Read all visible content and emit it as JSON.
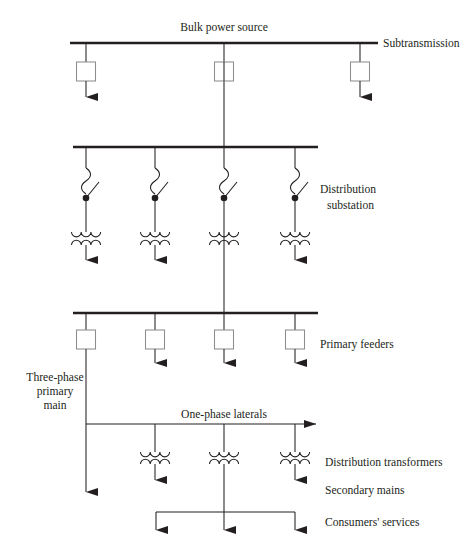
{
  "figure": {
    "stroke_color": "#231f20",
    "bus_color": "#231f20",
    "box_stroke": "#8d8d8d",
    "background": "#ffffff"
  },
  "labels": {
    "bulk_power_source": "Bulk power source",
    "subtransmission": "Subtransmission",
    "distribution_substation_line1": "Distribution",
    "distribution_substation_line2": "substation",
    "primary_feeders": "Primary feeders",
    "three_phase_line1": "Three-phase",
    "three_phase_line2": "primary",
    "three_phase_line3": "main",
    "one_phase_laterals": "One-phase laterals",
    "distribution_transformers": "Distribution transformers",
    "secondary_mains": "Secondary mains",
    "consumers_services": "Consumers' services"
  },
  "diagram_data": {
    "type": "diagram",
    "levels": [
      {
        "name": "subtransmission-bus",
        "bus_y": 43,
        "bus_x1": 70,
        "bus_x2": 378,
        "drops": [
          {
            "x": 86,
            "symbol": "breaker-box",
            "terminates": "arrow"
          },
          {
            "x": 224,
            "symbol": "breaker-box",
            "terminates": "continues-down"
          },
          {
            "x": 360,
            "symbol": "breaker-box",
            "terminates": "arrow"
          }
        ]
      },
      {
        "name": "distribution-substation-bus",
        "bus_y": 147,
        "bus_x1": 73,
        "bus_x2": 318,
        "drops": [
          {
            "x": 86,
            "symbol": "fuse-switch-transformer",
            "terminates": "arrow"
          },
          {
            "x": 155,
            "symbol": "fuse-switch-transformer",
            "terminates": "arrow"
          },
          {
            "x": 224,
            "symbol": "fuse-switch-transformer",
            "terminates": "continues-down"
          },
          {
            "x": 295,
            "symbol": "fuse-switch-transformer",
            "terminates": "arrow"
          }
        ]
      },
      {
        "name": "primary-feeders-bus",
        "bus_y": 313,
        "bus_x1": 73,
        "bus_x2": 318,
        "drops": [
          {
            "x": 86,
            "symbol": "breaker-box",
            "terminates": "continues-down"
          },
          {
            "x": 155,
            "symbol": "breaker-box",
            "terminates": "arrow"
          },
          {
            "x": 224,
            "symbol": "breaker-box",
            "terminates": "arrow"
          },
          {
            "x": 295,
            "symbol": "breaker-box",
            "terminates": "arrow"
          }
        ]
      },
      {
        "name": "one-phase-lateral-bus",
        "bus_y": 424,
        "bus_x1": 86,
        "bus_x2": 318,
        "arrow_end": "right",
        "drops": [
          {
            "x": 155,
            "symbol": "distribution-transformer",
            "terminates": "arrow"
          },
          {
            "x": 224,
            "symbol": "distribution-transformer",
            "terminates": "continues-down"
          },
          {
            "x": 295,
            "symbol": "distribution-transformer",
            "terminates": "arrow"
          }
        ]
      },
      {
        "name": "consumers-services-bus",
        "bus_y": 512,
        "bus_x1": 156,
        "bus_x2": 295,
        "drops": [
          {
            "x": 156,
            "symbol": "none",
            "terminates": "arrow"
          },
          {
            "x": 224,
            "symbol": "none",
            "terminates": "arrow"
          },
          {
            "x": 295,
            "symbol": "none",
            "terminates": "arrow"
          }
        ]
      }
    ],
    "symbol_legend": {
      "breaker-box": "square circuit breaker",
      "fuse-switch-transformer": "fuse (squiggle) + disconnect switch (dot + blade) + two-winding transformer",
      "distribution-transformer": "two-winding transformer coils",
      "arrow": "downward solid arrowhead (load)"
    }
  }
}
